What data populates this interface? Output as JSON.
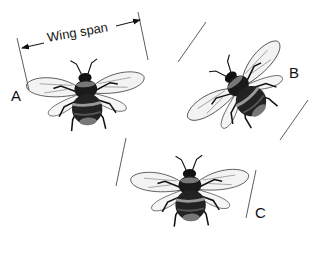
{
  "diagram": {
    "wingspan_label": "Wing span",
    "bees": [
      {
        "id": "A",
        "label": "A"
      },
      {
        "id": "B",
        "label": "B"
      },
      {
        "id": "C",
        "label": "C"
      }
    ]
  },
  "colors": {
    "ink": "#111111",
    "wing": "#f4f4f4",
    "background": "#ffffff"
  }
}
